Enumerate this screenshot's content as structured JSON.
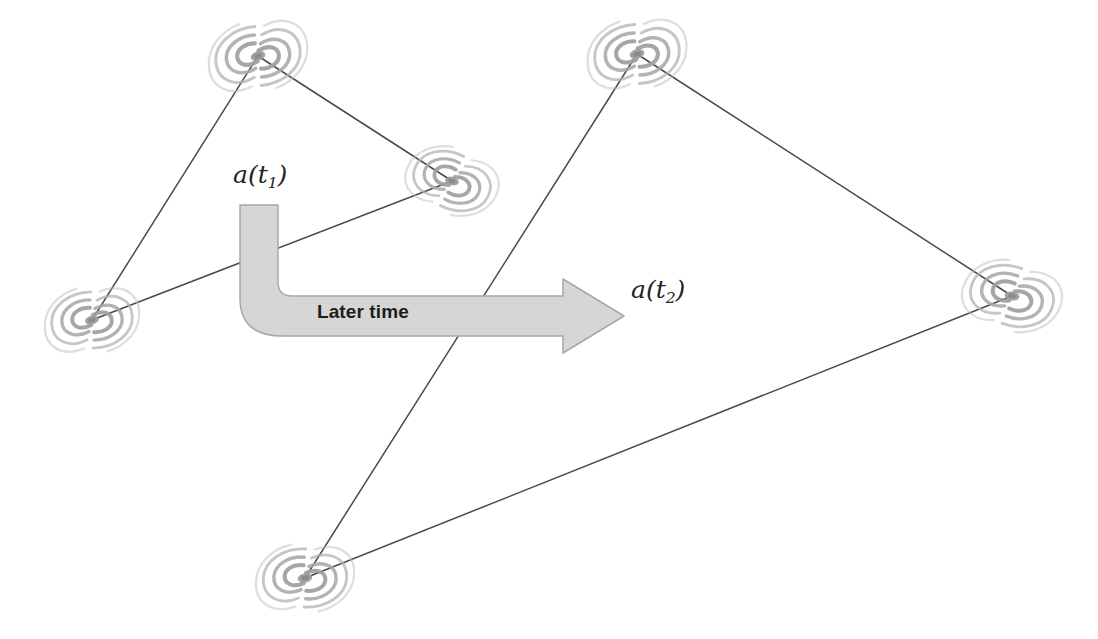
{
  "figure": {
    "background_color": "#ffffff",
    "line_color": "#4a4a4a",
    "galaxy_color": "#9a9a9a",
    "arrow_fill_color": "#d6d6d6",
    "arrow_stroke_color": "#a8a8a8",
    "text_color": "#242424"
  },
  "labels": {
    "scale_factor_early": "a(t₁)",
    "scale_factor_early_base": "a(t",
    "scale_factor_early_sub": "1",
    "scale_factor_early_close": ")",
    "scale_factor_late": "a(t₂)",
    "scale_factor_late_base": "a(t",
    "scale_factor_late_sub": "2",
    "scale_factor_late_close": ")",
    "arrow_caption": "Later time"
  },
  "triangles": [
    {
      "name": "early-time-triangle",
      "label": "a(t₁)",
      "vertices": [
        {
          "name": "galaxy-top-left",
          "x": 258,
          "y": 56
        },
        {
          "name": "galaxy-left",
          "x": 92,
          "y": 320
        },
        {
          "name": "galaxy-mid",
          "x": 452,
          "y": 181
        }
      ],
      "edges": [
        {
          "from": 0,
          "to": 1
        },
        {
          "from": 1,
          "to": 2
        },
        {
          "from": 2,
          "to": 0
        }
      ]
    },
    {
      "name": "late-time-triangle",
      "label": "a(t₂)",
      "vertices": [
        {
          "name": "galaxy-top-right",
          "x": 637,
          "y": 54
        },
        {
          "name": "galaxy-bottom",
          "x": 305,
          "y": 578
        },
        {
          "name": "galaxy-right",
          "x": 1012,
          "y": 296
        }
      ],
      "edges": [
        {
          "from": 0,
          "to": 1
        },
        {
          "from": 1,
          "to": 2
        },
        {
          "from": 2,
          "to": 0
        }
      ]
    }
  ],
  "galaxies": [
    {
      "name": "galaxy-top-left",
      "x": 258,
      "y": 56,
      "scale": 1.0,
      "rotation": -18
    },
    {
      "name": "galaxy-left",
      "x": 92,
      "y": 320,
      "scale": 0.95,
      "rotation": -14
    },
    {
      "name": "galaxy-mid",
      "x": 452,
      "y": 181,
      "scale": 0.92,
      "rotation": 14
    },
    {
      "name": "galaxy-top-right",
      "x": 637,
      "y": 54,
      "scale": 1.0,
      "rotation": -16
    },
    {
      "name": "galaxy-right",
      "x": 1012,
      "y": 296,
      "scale": 0.98,
      "rotation": 8
    },
    {
      "name": "galaxy-bottom",
      "x": 305,
      "y": 578,
      "scale": 0.98,
      "rotation": -10
    }
  ],
  "arrow": {
    "name": "later-time-arrow",
    "caption": "Later time",
    "shaft_top_x": 240,
    "shaft_top_y": 205,
    "shaft_width": 38,
    "corner_radius": 34,
    "horizontal_center_y": 316,
    "bar_half_height": 20,
    "head_tip_x": 624,
    "head_start_x": 563,
    "head_half_height": 37
  }
}
